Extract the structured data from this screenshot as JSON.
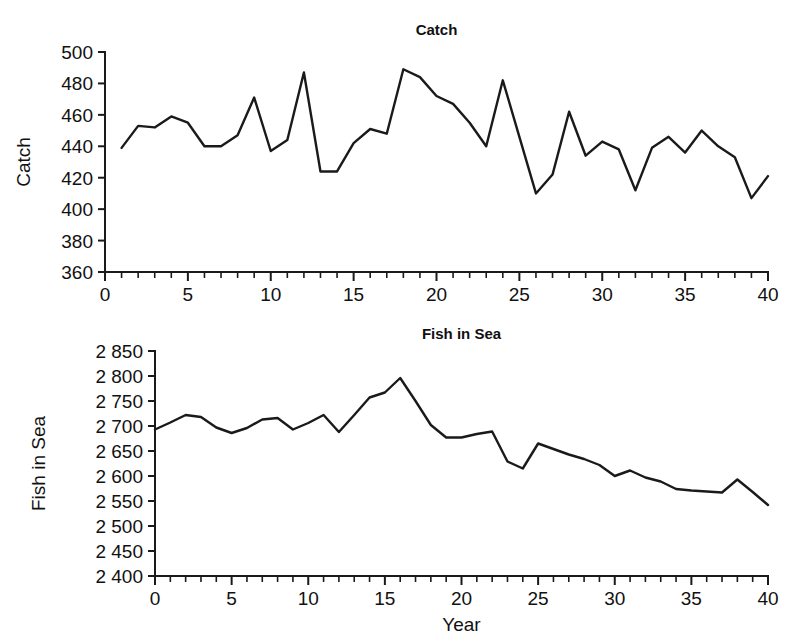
{
  "chart_data": [
    {
      "type": "line",
      "id": "catch",
      "title": "Catch",
      "xlabel": "",
      "ylabel": "Catch",
      "xlim": [
        0,
        40
      ],
      "ylim": [
        360,
        500
      ],
      "ytick_step": 20,
      "xtick_step": 5,
      "xtick_minor_step": 1,
      "grid": false,
      "legend": false,
      "line_color": "#1a1a1a",
      "ytick_labels": [
        "360",
        "380",
        "400",
        "420",
        "440",
        "460",
        "480",
        "500"
      ],
      "xtick_labels": [
        "0",
        "5",
        "10",
        "15",
        "20",
        "25",
        "30",
        "35",
        "40"
      ],
      "x": [
        1,
        2,
        3,
        4,
        5,
        6,
        7,
        8,
        9,
        10,
        11,
        12,
        13,
        14,
        15,
        16,
        17,
        18,
        19,
        20,
        21,
        22,
        23,
        24,
        25,
        26,
        27,
        28,
        29,
        30,
        31,
        32,
        33,
        34,
        35,
        36,
        37,
        38,
        39,
        40
      ],
      "values": [
        439,
        453,
        452,
        459,
        455,
        440,
        440,
        447,
        471,
        437,
        444,
        487,
        424,
        424,
        442,
        451,
        448,
        489,
        484,
        472,
        467,
        455,
        440,
        482,
        446,
        410,
        422,
        462,
        434,
        443,
        438,
        412,
        439,
        446,
        436,
        450,
        440,
        433,
        407,
        421,
        457
      ]
    },
    {
      "type": "line",
      "id": "fish-in-sea",
      "title": "Fish in Sea",
      "xlabel": "Year",
      "ylabel": "Fish in Sea",
      "xlim": [
        0,
        40
      ],
      "ylim": [
        2400,
        2850
      ],
      "ytick_step": 50,
      "xtick_step": 5,
      "xtick_minor_step": 1,
      "grid": false,
      "legend": false,
      "line_color": "#1a1a1a",
      "ytick_labels": [
        "2 400",
        "2 450",
        "2 500",
        "2 550",
        "2 600",
        "2 650",
        "2 700",
        "2 750",
        "2 800",
        "2 850"
      ],
      "xtick_labels": [
        "0",
        "5",
        "10",
        "15",
        "20",
        "25",
        "30",
        "35",
        "40"
      ],
      "x": [
        0,
        1,
        2,
        3,
        4,
        5,
        6,
        7,
        8,
        9,
        10,
        11,
        12,
        13,
        14,
        15,
        16,
        17,
        18,
        19,
        20,
        21,
        22,
        23,
        24,
        25,
        26,
        27,
        28,
        29,
        30,
        31,
        32,
        33,
        34,
        35,
        36,
        37,
        38,
        39,
        40
      ],
      "values": [
        2693,
        2707,
        2722,
        2718,
        2697,
        2686,
        2696,
        2713,
        2716,
        2693,
        2706,
        2722,
        2688,
        2722,
        2757,
        2767,
        2796,
        2750,
        2702,
        2677,
        2677,
        2684,
        2689,
        2629,
        2615,
        2665,
        2654,
        2643,
        2634,
        2622,
        2600,
        2611,
        2597,
        2589,
        2574,
        2571,
        2569,
        2567,
        2593,
        2568,
        2542
      ]
    }
  ]
}
